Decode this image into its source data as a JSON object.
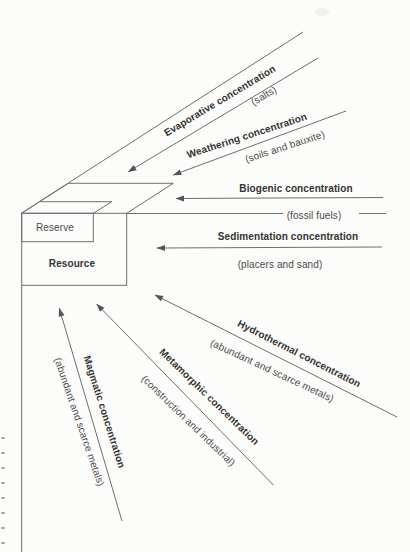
{
  "figure": {
    "colors": {
      "background": "#fcfcfa",
      "line": "#6e6e6e",
      "arrowhead": "#555555",
      "title_text": "#333333",
      "subtitle_text": "#4a4a4a"
    },
    "box": {
      "reserve_label": "Reserve",
      "resource_label": "Resource"
    },
    "processes": [
      {
        "name": "evaporative",
        "title": "Evaporative concentration",
        "subtitle": "(salts)"
      },
      {
        "name": "weathering",
        "title": "Weathering concentration",
        "subtitle": "(soils and bauxite)"
      },
      {
        "name": "biogenic",
        "title": "Biogenic concentration",
        "subtitle": "(fossil fuels)"
      },
      {
        "name": "sedimentation",
        "title": "Sedimentation concentration",
        "subtitle": "(placers and sand)"
      },
      {
        "name": "hydrothermal",
        "title": "Hydrothermal concentration",
        "subtitle": "(abundant and scarce metals)"
      },
      {
        "name": "metamorphic",
        "title": "Metamorphic concentration",
        "subtitle": "(construction and industrial)"
      },
      {
        "name": "magmatic",
        "title": "Magmatic concentration",
        "subtitle": "(abundant and scarce metals)"
      }
    ]
  }
}
